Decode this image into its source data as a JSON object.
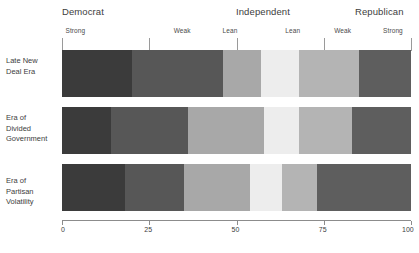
{
  "chart_data": {
    "type": "bar",
    "orientation": "horizontal-stacked",
    "title": "",
    "xlabel": "",
    "ylabel": "",
    "xlim": [
      0,
      100
    ],
    "grid": false,
    "legend_position": "top",
    "axis": {
      "ticks": [
        0,
        25,
        50,
        75,
        100
      ],
      "tick_labels": [
        "0",
        "25",
        "50",
        "75",
        "100"
      ]
    },
    "group_headers": [
      {
        "label": "Democrat",
        "center": 13
      },
      {
        "label": "Independent",
        "center": 50
      },
      {
        "label": "Republican",
        "center": 88
      }
    ],
    "strength_headers": [
      {
        "label": "Strong",
        "pos": 1
      },
      {
        "label": "Weak",
        "pos": 32
      },
      {
        "label": "Lean",
        "pos": 46
      },
      {
        "label": "Lean",
        "pos": 64
      },
      {
        "label": "Weak",
        "pos": 78
      },
      {
        "label": "Strong",
        "pos": 92
      }
    ],
    "header_ticks": [
      0,
      25,
      50,
      75,
      100
    ],
    "categories": [
      "Strong Democrat",
      "Weak Democrat",
      "Lean Democrat",
      "Lean Republican",
      "Weak Republican",
      "Strong Republican"
    ],
    "series": [
      {
        "name": "Late New Deal Era",
        "label_lines": "Late New\nDeal Era",
        "values": [
          20,
          26,
          11,
          11,
          17,
          15
        ]
      },
      {
        "name": "Era of Divided Government",
        "label_lines": "Era of\nDivided\nGovernment",
        "values": [
          14,
          22,
          22,
          10,
          15,
          17
        ]
      },
      {
        "name": "Era of Partisan Volatility",
        "label_lines": "Era of\nPartisan\nVolatility",
        "values": [
          18,
          17,
          19,
          9,
          10,
          27
        ]
      }
    ],
    "segment_colors": [
      "#3b3b3b",
      "#575757",
      "#a8a8a8",
      "#ededed",
      "#b4b4b4",
      "#5e5e5e",
      "#333333"
    ],
    "row_colors": [
      [
        "#3b3b3b",
        "#575757",
        "#a8a8a8",
        "#ededed",
        "#b4b4b4",
        "#5e5e5e"
      ],
      [
        "#3b3b3b",
        "#575757",
        "#a8a8a8",
        "#ededed",
        "#b4b4b4",
        "#5e5e5e"
      ],
      [
        "#3b3b3b",
        "#575757",
        "#a8a8a8",
        "#ededed",
        "#b4b4b4",
        "#5e5e5e"
      ]
    ]
  },
  "caption": "",
  "colors": {
    "background": "#ffffff",
    "axis": "#8c8c8c",
    "text": "#3d3d3d"
  }
}
